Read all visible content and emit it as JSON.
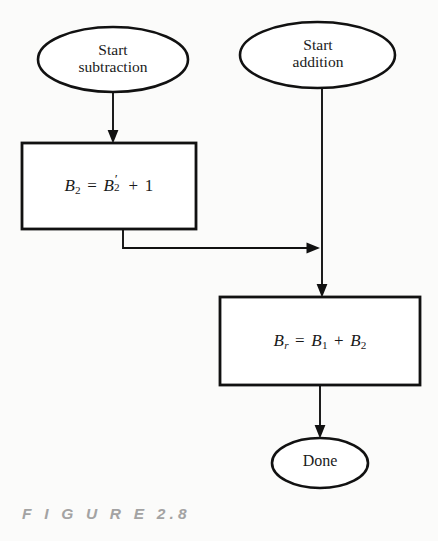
{
  "figure": {
    "caption": "F I G U R E   2.8",
    "caption_color": "#a3a3a3",
    "background_color": "#fbfbfa",
    "stroke_color": "#111111"
  },
  "nodes": {
    "start_subtraction": {
      "shape": "ellipse",
      "line1": "Start",
      "line2": "subtraction"
    },
    "start_addition": {
      "shape": "ellipse",
      "line1": "Start",
      "line2": "addition"
    },
    "process_twos_complement": {
      "shape": "rectangle",
      "formula_plain": "B2 = B2' + 1",
      "lhs_base": "B",
      "lhs_sub": "2",
      "equals": "=",
      "rhs_base": "B",
      "rhs_prime": "′",
      "rhs_sub": "2",
      "plus": "+",
      "addend": "1"
    },
    "process_add": {
      "shape": "rectangle",
      "formula_plain": "Br = B1 + B2",
      "lhs_base": "B",
      "lhs_sub": "r",
      "equals": "=",
      "op1_base": "B",
      "op1_sub": "1",
      "plus": "+",
      "op2_base": "B",
      "op2_sub": "2"
    },
    "done": {
      "shape": "ellipse",
      "label": "Done"
    }
  },
  "edges": [
    {
      "name": "subtraction-to-complement",
      "from": "start_subtraction",
      "to": "process_twos_complement",
      "arrow": true
    },
    {
      "name": "complement-to-merge",
      "from": "process_twos_complement",
      "to": "addition_trunk",
      "arrow": true
    },
    {
      "name": "addition-to-add",
      "from": "start_addition",
      "to": "process_add",
      "arrow": true
    },
    {
      "name": "add-to-done",
      "from": "process_add",
      "to": "done",
      "arrow": true
    }
  ]
}
